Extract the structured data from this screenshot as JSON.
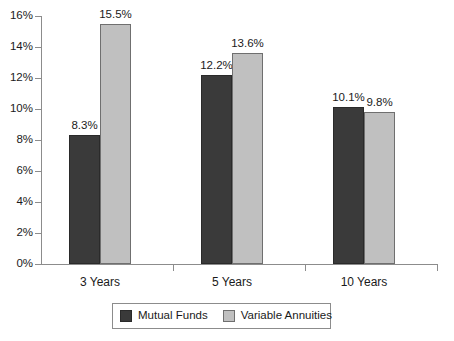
{
  "chart_data": {
    "type": "bar",
    "title": "",
    "subtitle": "",
    "xlabel": "",
    "ylabel": "",
    "categories": [
      "3 Years",
      "5 Years",
      "10 Years"
    ],
    "series": [
      {
        "name": "Mutual Funds",
        "color": "#3a3a3a",
        "values": [
          8.3,
          12.2,
          10.1
        ],
        "labels": [
          "8.3%",
          "12.2%",
          "10.1%"
        ]
      },
      {
        "name": "Variable Annuities",
        "color": "#c0c0c0",
        "values": [
          15.5,
          13.6,
          9.8
        ],
        "labels": [
          "15.5%",
          "13.6%",
          "9.8%"
        ]
      }
    ],
    "ylim": [
      0,
      16
    ],
    "ytick_step": 2,
    "ytick_values": [
      0,
      2,
      4,
      6,
      8,
      10,
      12,
      14,
      16
    ],
    "ytick_labels": [
      "0%",
      "2%",
      "4%",
      "6%",
      "8%",
      "10%",
      "12%",
      "14%",
      "16%"
    ],
    "grid": false,
    "legend_position": "bottom",
    "axis_color": "#8c8c8c",
    "value_labels_shown": true
  }
}
